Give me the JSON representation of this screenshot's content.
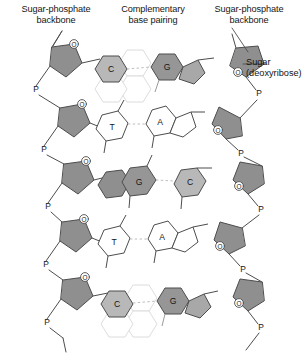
{
  "figure": {
    "labels": {
      "left_backbone": "Sugar-phosphate\nbackbone",
      "center_pairing": "Complementary\nbase pairing",
      "right_backbone": "Sugar-phosphate\nbackbone",
      "sugar": "Sugar\n(deoxyribose)"
    },
    "atom_labels": {
      "phosphate": "P",
      "oxygen": "O"
    },
    "colors": {
      "stroke": "#4d4d4d",
      "sugar_fill": "#8f8f8f",
      "purine_ring_fill": "#969696",
      "purine_pentagon_fill": "#a8a8a8",
      "pyrimidine_fill": "#b8b8b8",
      "unshaded_fill": "#ffffff",
      "hbond": "#c8c8c8",
      "text": "#151515"
    },
    "rungs": [
      {
        "index": 1,
        "left_base": "C",
        "left_type": "pyrimidine",
        "left_shaded": true,
        "right_base": "G",
        "right_type": "purine",
        "right_shaded": true
      },
      {
        "index": 2,
        "left_base": "T",
        "left_type": "pyrimidine",
        "left_shaded": false,
        "right_base": "A",
        "right_type": "purine",
        "right_shaded": false
      },
      {
        "index": 3,
        "left_base": "G",
        "left_type": "purine",
        "left_shaded": true,
        "right_base": "C",
        "right_type": "pyrimidine",
        "right_shaded": true
      },
      {
        "index": 4,
        "left_base": "T",
        "left_type": "pyrimidine",
        "left_shaded": false,
        "right_base": "A",
        "right_type": "purine",
        "right_shaded": false
      },
      {
        "index": 5,
        "left_base": "C",
        "left_type": "pyrimidine",
        "left_shaded": true,
        "right_base": "G",
        "right_type": "purine",
        "right_shaded": true
      }
    ],
    "phosphate_count_left": 6,
    "phosphate_count_right": 6,
    "sugar_count_left": 5,
    "sugar_count_right": 5
  }
}
